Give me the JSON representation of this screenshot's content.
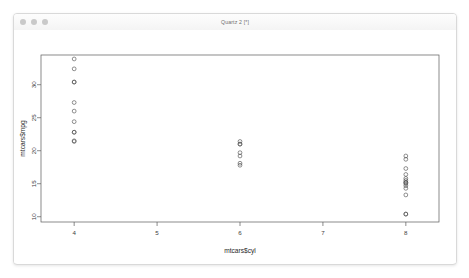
{
  "window": {
    "title": "Quartz 2 [*]",
    "traffic_lights": [
      "close",
      "minimize",
      "zoom"
    ]
  },
  "chart_data": {
    "type": "scatter",
    "title": "",
    "xlabel": "mtcars$cyl",
    "ylabel": "mtcars$mpg",
    "xlim": [
      3.6,
      8.4
    ],
    "ylim": [
      9.2,
      34.5
    ],
    "xticks": [
      4,
      5,
      6,
      7,
      8
    ],
    "xticklabels": [
      "4",
      "5",
      "6",
      "7",
      "8"
    ],
    "yticks": [
      10,
      15,
      20,
      25,
      30
    ],
    "yticklabels": [
      "10",
      "15",
      "20",
      "25",
      "30"
    ],
    "grid": false,
    "legend": false,
    "marker": "open-circle",
    "marker_color": "#4a4a4a",
    "series": [
      {
        "name": "mtcars",
        "x": [
          6,
          6,
          4,
          6,
          8,
          6,
          8,
          4,
          4,
          6,
          6,
          8,
          8,
          8,
          8,
          8,
          8,
          4,
          4,
          4,
          4,
          8,
          8,
          8,
          8,
          4,
          4,
          4,
          8,
          6,
          8,
          4
        ],
        "y": [
          21.0,
          21.0,
          22.8,
          21.4,
          18.7,
          18.1,
          14.3,
          24.4,
          22.8,
          19.2,
          17.8,
          16.4,
          17.3,
          15.2,
          10.4,
          10.4,
          14.7,
          32.4,
          30.4,
          33.9,
          21.5,
          15.5,
          15.2,
          13.3,
          19.2,
          27.3,
          26.0,
          30.4,
          15.8,
          19.7,
          15.0,
          21.4
        ]
      }
    ]
  }
}
